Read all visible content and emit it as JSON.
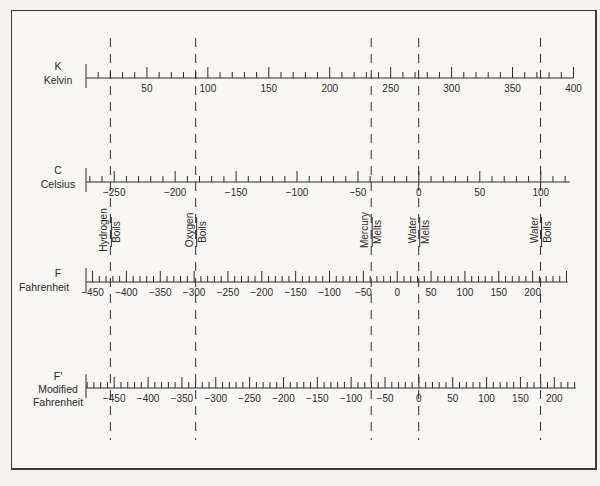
{
  "scales": [
    {
      "id": "kelvin",
      "symbol": "K",
      "name": "Kelvin",
      "tick_labels": [
        "50",
        "100",
        "150",
        "200",
        "250",
        "300",
        "350",
        "400"
      ]
    },
    {
      "id": "celsius",
      "symbol": "C",
      "name": "Celsius",
      "tick_labels": [
        "−250",
        "−200",
        "−150",
        "−100",
        "−50",
        "0",
        "50",
        "100"
      ]
    },
    {
      "id": "fahrenheit",
      "symbol": "F",
      "name": "Fahrenheit",
      "tick_labels": [
        "−450",
        "−400",
        "−350",
        "−300",
        "−250",
        "−200",
        "−150",
        "−100",
        "−50",
        "0",
        "50",
        "100",
        "150",
        "200"
      ]
    },
    {
      "id": "modified-fahrenheit",
      "symbol": "F′",
      "name_line1": "Modified",
      "name_line2": "Fahrenheit",
      "tick_labels": [
        "−450",
        "−400",
        "−350",
        "−300",
        "−250",
        "−200",
        "−150",
        "−100",
        "−50",
        "0",
        "50",
        "100",
        "150",
        "200"
      ]
    }
  ],
  "reference_points": [
    {
      "id": "hydrogen-boils",
      "line1": "Hydrogen",
      "line2": "Boils",
      "kelvin": 20
    },
    {
      "id": "oxygen-boils",
      "line1": "Oxygen",
      "line2": "Boils",
      "kelvin": 90
    },
    {
      "id": "mercury-melts",
      "line1": "Mercury",
      "line2": "Melts",
      "kelvin": 234
    },
    {
      "id": "water-melts",
      "line1": "Water",
      "line2": "Melts",
      "kelvin": 273
    },
    {
      "id": "water-boils",
      "line1": "Water",
      "line2": "Boils",
      "kelvin": 373
    }
  ]
}
